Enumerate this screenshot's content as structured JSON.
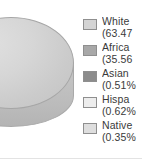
{
  "chart_data": {
    "type": "pie",
    "title": "",
    "subtitle": "",
    "xlabel": "",
    "ylabel": "",
    "grid": false,
    "legend_position": "right",
    "three_d": true,
    "note": "cropped view: pie clipped at left edge, legend text clipped at right edge",
    "categories": [
      "White",
      "African American",
      "Asian",
      "Hispanic",
      "Native American"
    ],
    "values": [
      63.47,
      35.56,
      0.51,
      0.62,
      0.35
    ],
    "value_unit": "%",
    "colors": [
      "#d4d4d4",
      "#a8a8a8",
      "#8c8c8c",
      "#ededed",
      "#dedede"
    ]
  },
  "legend": {
    "items": [
      {
        "label": "White",
        "value": "(63.47",
        "swatch_color": "#d4d4d4",
        "swatch_name": "legend-swatch-white"
      },
      {
        "label": "Africa",
        "value": "(35.56",
        "swatch_color": "#a8a8a8",
        "swatch_name": "legend-swatch-african-american"
      },
      {
        "label": "Asian",
        "value": "(0.51%",
        "swatch_color": "#8c8c8c",
        "swatch_name": "legend-swatch-asian"
      },
      {
        "label": "Hispa",
        "value": "(0.62%",
        "swatch_color": "#ededed",
        "swatch_name": "legend-swatch-hispanic"
      },
      {
        "label": "Native",
        "value": "(0.35%",
        "swatch_color": "#dedede",
        "swatch_name": "legend-swatch-native-american"
      }
    ]
  },
  "pie": {
    "dominant_slice_color": "#d6d6d6",
    "side_color": "#c2c2c2",
    "outline_color": "#a6a6a6"
  }
}
